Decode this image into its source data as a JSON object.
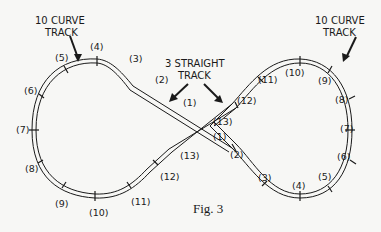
{
  "figure": {
    "caption": "Fig. 3",
    "colors": {
      "ink": "#1a1a1a",
      "paper": "#f7f7f5"
    }
  },
  "callouts": {
    "left_curve_line1": "10 CURVE",
    "left_curve_line2": "TRACK",
    "right_curve_line1": "10 CURVE",
    "right_curve_line2": "TRACK",
    "straight_line1": "3 STRAIGHT",
    "straight_line2": "TRACK"
  },
  "left_loop_labels": [
    "(3)",
    "(4)",
    "(5)",
    "(6)",
    "(7)",
    "(8)",
    "(9)",
    "(10)",
    "(11)",
    "(12)"
  ],
  "right_loop_labels": [
    "(3)",
    "(4)",
    "(5)",
    "(6)",
    "(7)",
    "(8)",
    "(9)",
    "(10)",
    "(11)",
    "(12)"
  ],
  "straight_a_labels": [
    "(1)",
    "(2)",
    "(13)"
  ],
  "straight_b_labels": [
    "(1)",
    "(2)",
    "(13)"
  ]
}
